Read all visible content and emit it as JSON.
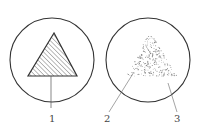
{
  "figure": {
    "left_panel": {
      "description": "Solid triangular crystal with hatching inside a circular field of view",
      "labels": [
        {
          "text": "1"
        }
      ]
    },
    "right_panel": {
      "description": "Triangular region of dispersed dots inside a circular field of view",
      "labels": [
        {
          "text": "2"
        },
        {
          "text": "3"
        }
      ]
    },
    "colors": {
      "stroke": "#333333",
      "hatch": "#555555",
      "dots": "#888888"
    }
  }
}
